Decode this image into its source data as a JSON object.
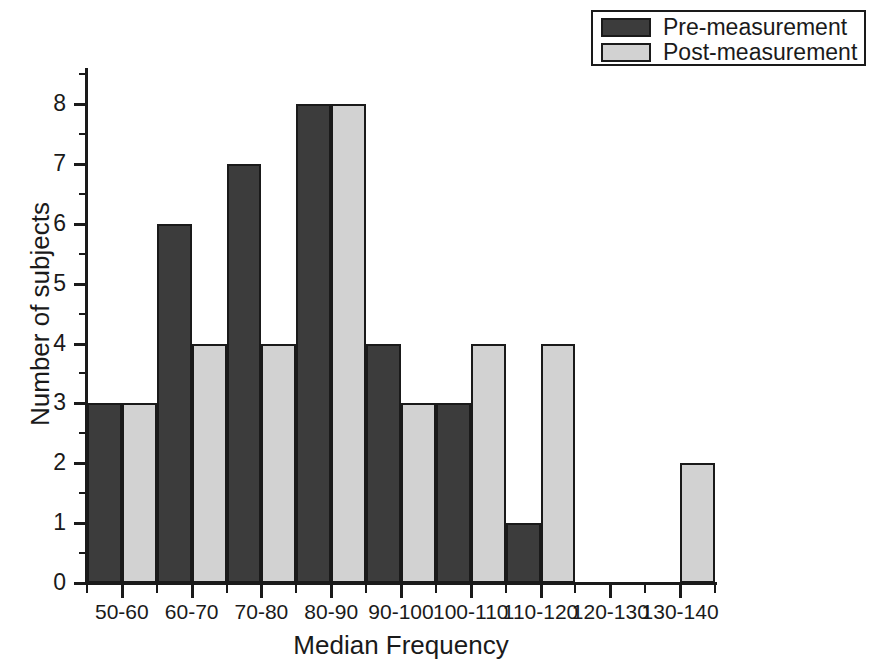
{
  "chart_data": {
    "type": "bar",
    "title": "",
    "xlabel": "Median Frequency",
    "ylabel": "Number of subjects",
    "categories": [
      "50-60",
      "60-70",
      "70-80",
      "80-90",
      "90-100",
      "100-110",
      "110-120",
      "120-130",
      "130-140"
    ],
    "series": [
      {
        "name": "Pre-measurement",
        "color": "#3c3c3c",
        "values": [
          3,
          6,
          7,
          8,
          4,
          3,
          1,
          0,
          0
        ]
      },
      {
        "name": "Post-measurement",
        "color": "#d2d2d2",
        "values": [
          3,
          4,
          4,
          8,
          3,
          4,
          4,
          0,
          2
        ]
      }
    ],
    "ylim": [
      0,
      8
    ],
    "ytick_labels": [
      "0",
      "1",
      "2",
      "3",
      "4",
      "5",
      "6",
      "7",
      "8"
    ],
    "ytick_values": [
      0,
      1,
      2,
      3,
      4,
      5,
      6,
      7,
      8
    ],
    "yminor_values": [
      0.5,
      1.5,
      2.5,
      3.5,
      4.5,
      5.5,
      6.5,
      7.5,
      8.5
    ],
    "grid": false,
    "legend_position": "top-right",
    "legend_entries": [
      "Pre-measurement",
      "Post-measurement"
    ],
    "bar_style": "grouped-adjacent",
    "axis_color": "#1a1a1a",
    "background": "#ffffff"
  },
  "legend": {
    "items": [
      {
        "label": "Pre-measurement",
        "swatch": "pre"
      },
      {
        "label": "Post-measurement",
        "swatch": "post"
      }
    ]
  }
}
